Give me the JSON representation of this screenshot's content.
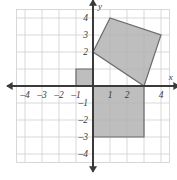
{
  "figure": {
    "title": "",
    "background_color": "#ffffff"
  },
  "chart_data": {
    "type": "scatter",
    "title": "",
    "xlabel": "x",
    "ylabel": "y",
    "xlim": [
      -4.8,
      4.8
    ],
    "ylim": [
      -4.8,
      4.8
    ],
    "grid": true,
    "grid_color": "#cfcfcf",
    "grid_step": 1,
    "axis_color": "#3a3a3a",
    "x_ticks": [
      -4,
      -3,
      -2,
      -1,
      1,
      2,
      4
    ],
    "x_tick_labels": [
      "–4",
      "–3",
      "–2",
      "–1",
      "1",
      "2",
      "4"
    ],
    "y_ticks": [
      4,
      3,
      2,
      -1,
      -2,
      -3,
      -4
    ],
    "y_tick_labels": [
      "4",
      "3",
      "2",
      "–1",
      "–2",
      "–3",
      "–4"
    ],
    "shapes": [
      {
        "name": "tilted-square",
        "type": "polygon",
        "points": [
          [
            0,
            2
          ],
          [
            1,
            4
          ],
          [
            4,
            3
          ],
          [
            3,
            0
          ]
        ],
        "fill": "#b3b3b3",
        "fill_opacity": 0.85,
        "stroke": "#6b6b6b",
        "stroke_width": 1.2
      },
      {
        "name": "small-square",
        "type": "polygon",
        "points": [
          [
            -1,
            0
          ],
          [
            0,
            0
          ],
          [
            0,
            1
          ],
          [
            -1,
            1
          ]
        ],
        "fill": "#b3b3b3",
        "fill_opacity": 0.85,
        "stroke": "#6b6b6b",
        "stroke_width": 1.2
      },
      {
        "name": "large-square",
        "type": "polygon",
        "points": [
          [
            0,
            0
          ],
          [
            3,
            0
          ],
          [
            3,
            -3
          ],
          [
            0,
            -3
          ]
        ],
        "fill": "#b3b3b3",
        "fill_opacity": 0.85,
        "stroke": "#6b6b6b",
        "stroke_width": 1.2
      }
    ]
  },
  "axes": {
    "x_axis_label": "x",
    "y_axis_label": "y"
  }
}
